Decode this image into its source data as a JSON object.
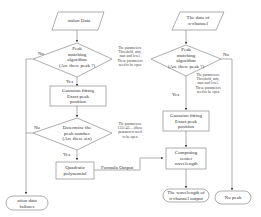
{
  "left_flow": {
    "input": "stalon Data",
    "decision1": {
      "lines": [
        "Peak",
        "matching",
        "algorithm",
        "(Are there peak ?)"
      ],
      "no": "No",
      "yes": "Yes"
    },
    "note1": [
      "The parameters:",
      "Threshold, min,",
      "max and   level.",
      "These parameters",
      "need to be open"
    ],
    "gauss": [
      "Gaussian fitting",
      "Exact peak",
      "position"
    ],
    "decision2": {
      "lines": [
        "Determine the",
        "peak number",
        "(Are there six)"
      ],
      "no": "No",
      "yes": "Yes"
    },
    "note2": [
      "The parameters:",
      "1551.43.....(these",
      "parameters need",
      "to be open"
    ],
    "quadratic": [
      "Quadratic",
      "polynomial"
    ],
    "formula_output": "Formula Output",
    "failure": [
      "ation data",
      "failures"
    ]
  },
  "right_flow": {
    "input": [
      "The data of",
      "n-channel"
    ],
    "decision1": {
      "lines": [
        "Peak",
        "matching",
        "algorithm",
        "(Are there peak ?)"
      ],
      "no": "No",
      "yes": "Yes"
    },
    "note1": [
      "The parameters:",
      "Threshold, min,",
      "max and   level.",
      "These parameters",
      "need to be open"
    ],
    "gauss": [
      "Gaussian fitting",
      "Exact peak",
      "position"
    ],
    "computing": [
      "Computing",
      "center",
      "wavelength"
    ],
    "output": [
      "The wavelength of",
      "n-channel  output"
    ],
    "no_peak": "No peak"
  },
  "colors": {
    "line": "#555555",
    "box": "#888888",
    "text": "#333333"
  }
}
